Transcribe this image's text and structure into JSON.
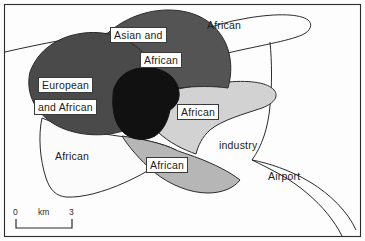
{
  "figure": {
    "kind": "ethnic-residential-zone-map",
    "frame_color": "#2b2b2b",
    "background_color": "#fdfdfd"
  },
  "zones": {
    "european_african": {
      "label_line1": "European",
      "label_line2": "and African",
      "fill": "#4a4a4a",
      "boxed": true
    },
    "asian_african": {
      "label_line1": "Asian and",
      "label_line2": "African",
      "fill": "#545454",
      "boxed": true
    },
    "core": {
      "label": "",
      "fill": "#111111",
      "boxed": false
    },
    "african_tongue": {
      "label": "African",
      "fill": "#d2d2d2",
      "boxed": true
    },
    "african_bottom_wedge": {
      "label": "African",
      "fill": "#b6b6b6",
      "boxed": true
    },
    "african_bottom_left": {
      "label": "African",
      "fill": "#fbfbfb",
      "boxed": false
    },
    "african_top_right": {
      "label": "African",
      "fill": "#fdfdfd",
      "boxed": false
    }
  },
  "annotations": [
    {
      "name": "industry",
      "text": "industry"
    },
    {
      "name": "airport",
      "text": "Airport"
    }
  ],
  "scale_bar": {
    "left_value": "0",
    "unit": "km",
    "right_value": "3"
  }
}
